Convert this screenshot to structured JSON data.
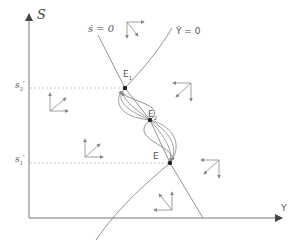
{
  "diagram": {
    "axes": {
      "vertical_label": "S",
      "horizontal_label": "Y"
    },
    "curves": {
      "s_dot_zero_label": "ṡ = 0",
      "y_dot_zero_label": "Ẏ = 0"
    },
    "levels": {
      "upper_label": "s",
      "upper_sub": "3",
      "upper_prime": "′",
      "lower_label": "s",
      "lower_sub": "1",
      "lower_prime": "′"
    },
    "equilibria": [
      {
        "label": "E",
        "sub": "1",
        "x": 125,
        "y": 88
      },
      {
        "label": "E",
        "sub": "2",
        "x": 150,
        "y": 120
      },
      {
        "label": "E",
        "sub": "",
        "x": 170,
        "y": 163
      }
    ],
    "direction_fields": [
      {
        "region": "top-center",
        "horizontal": "right",
        "vertical": "down"
      },
      {
        "region": "upper-right",
        "horizontal": "left",
        "vertical": "down"
      },
      {
        "region": "upper-left",
        "horizontal": "right",
        "vertical": "up"
      },
      {
        "region": "lower-left",
        "horizontal": "right",
        "vertical": "up"
      },
      {
        "region": "lower-right",
        "horizontal": "left",
        "vertical": "down"
      },
      {
        "region": "bottom-center",
        "horizontal": "left",
        "vertical": "up"
      }
    ],
    "colors": {
      "line": "#888888",
      "axis": "#777777",
      "dashed": "#bbbbbb",
      "point": "#222222",
      "text": "#555555"
    }
  }
}
